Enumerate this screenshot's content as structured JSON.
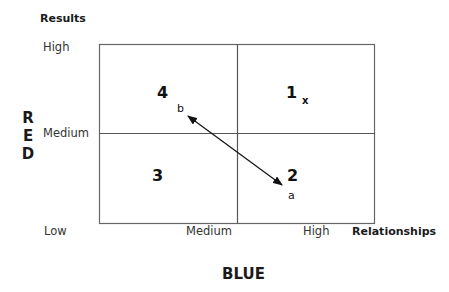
{
  "y_axis": {
    "title": "Results",
    "ticks": [
      "High",
      "Medium",
      "Low"
    ],
    "side_label_letters": [
      "R",
      "E",
      "D"
    ],
    "side_label": "RED"
  },
  "x_axis": {
    "title": "Relationships",
    "ticks": [
      "Low",
      "Medium",
      "High"
    ],
    "bottom_label": "BLUE"
  },
  "quadrants": [
    {
      "id": "1",
      "label": "1",
      "position": "top-right"
    },
    {
      "id": "2",
      "label": "2",
      "position": "bottom-right"
    },
    {
      "id": "3",
      "label": "3",
      "position": "bottom-left"
    },
    {
      "id": "4",
      "label": "4",
      "position": "top-left"
    }
  ],
  "points": [
    {
      "label": "x",
      "quadrant": "1"
    },
    {
      "label": "b",
      "quadrant": "4"
    },
    {
      "label": "a",
      "quadrant": "2"
    }
  ],
  "arrow": {
    "from": "b",
    "to": "a",
    "style": "double-headed"
  },
  "colors": {
    "grid_line": "#555555",
    "text": "#1a1a1a",
    "background": "#ffffff"
  }
}
